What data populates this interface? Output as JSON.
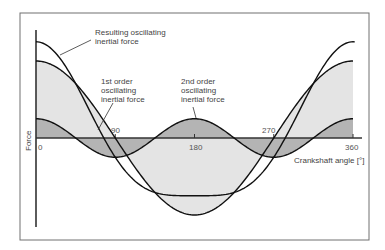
{
  "diagram": {
    "title": "",
    "y_axis_label": "Force",
    "x_axis_label": "Crankshaft angle [°]",
    "x_ticks": [
      "0",
      "90",
      "180",
      "270",
      "360"
    ],
    "x_range_deg": [
      0,
      360
    ],
    "colors": {
      "frame": "#707070",
      "axis": "#333333",
      "curve": "#111111",
      "first_order_fill": "#e4e4e4",
      "second_order_fill": "#b4b4b4",
      "background": "#ffffff"
    },
    "curves": [
      {
        "id": "resulting",
        "label": "Resulting oscillating inertial force",
        "formula": "cos(θ) + λ·cos(2θ)"
      },
      {
        "id": "first_order",
        "label": "1st order oscillating inertial force",
        "formula": "cos(θ)",
        "relative_amplitude": 1.0
      },
      {
        "id": "second_order",
        "label": "2nd order oscillating inertial force",
        "formula": "λ·cos(2θ)",
        "relative_amplitude": 0.25
      }
    ],
    "annotations": [
      {
        "text_lines": [
          "Resulting oscillating",
          "inertial force"
        ],
        "target": "resulting"
      },
      {
        "text_lines": [
          "1st order",
          "oscillating",
          "inertial force"
        ],
        "target": "first_order"
      },
      {
        "text_lines": [
          "2nd order",
          "oscillating",
          "inertial force"
        ],
        "target": "second_order"
      }
    ]
  }
}
